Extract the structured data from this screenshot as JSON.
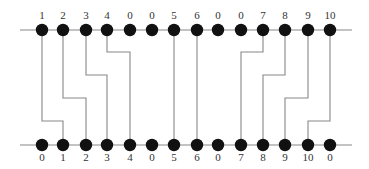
{
  "diagram": {
    "top_rail": {
      "y": 30,
      "x1": 20,
      "x2": 352
    },
    "bottom_rail": {
      "y": 145,
      "x1": 20,
      "x2": 352
    },
    "node_x": [
      42,
      63,
      86,
      107,
      130,
      152,
      174,
      197,
      218,
      241,
      263,
      285,
      308,
      330
    ],
    "top_labels": [
      "1",
      "2",
      "3",
      "4",
      "0",
      "0",
      "5",
      "6",
      "0",
      "0",
      "7",
      "8",
      "9",
      "10"
    ],
    "bottom_labels": [
      "0",
      "1",
      "2",
      "3",
      "4",
      "0",
      "5",
      "6",
      "0",
      "7",
      "8",
      "9",
      "10",
      "0"
    ],
    "connections": [
      {
        "value": "1",
        "from_top": 0,
        "to_bottom": 1,
        "bend_y": 121
      },
      {
        "value": "2",
        "from_top": 1,
        "to_bottom": 2,
        "bend_y": 98
      },
      {
        "value": "3",
        "from_top": 2,
        "to_bottom": 3,
        "bend_y": 75
      },
      {
        "value": "4",
        "from_top": 3,
        "to_bottom": 4,
        "bend_y": 52
      },
      {
        "value": "5",
        "from_top": 6,
        "to_bottom": 6,
        "bend_y": null
      },
      {
        "value": "6",
        "from_top": 7,
        "to_bottom": 7,
        "bend_y": null
      },
      {
        "value": "7",
        "from_top": 10,
        "to_bottom": 9,
        "bend_y": 52
      },
      {
        "value": "8",
        "from_top": 11,
        "to_bottom": 10,
        "bend_y": 75
      },
      {
        "value": "9",
        "from_top": 12,
        "to_bottom": 11,
        "bend_y": 98
      },
      {
        "value": "10",
        "from_top": 13,
        "to_bottom": 12,
        "bend_y": 121
      }
    ],
    "colors": {
      "dot": "#111111",
      "line": "#888888",
      "text": "#333333"
    }
  }
}
